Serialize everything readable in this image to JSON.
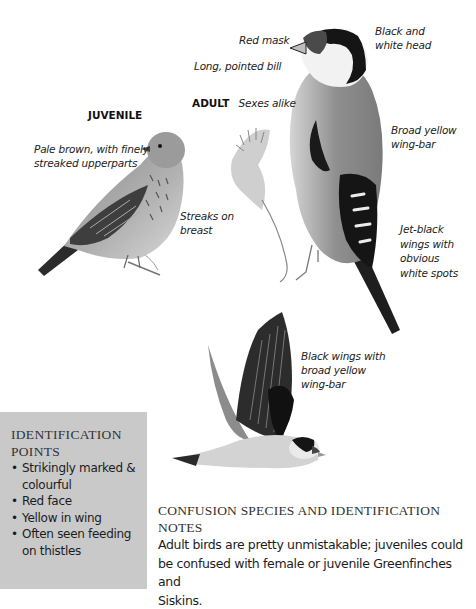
{
  "illustrations": {
    "juvenile": {
      "heading": "JUVENILE",
      "labels": {
        "upperparts": "Pale brown, with finely streaked  upperparts",
        "upperparts_line1": "Pale brown, with finely",
        "upperparts_line2": "streaked  upperparts",
        "breast_line1": "Streaks on",
        "breast_line2": "breast"
      }
    },
    "adult": {
      "heading": "ADULT",
      "subheading": "Sexes alike",
      "labels": {
        "red_mask": "Red mask",
        "bill": "Long, pointed bill",
        "head_line1": "Black and",
        "head_line2": "white head",
        "wingbar_line1": "Broad yellow",
        "wingbar_line2": "wing-bar",
        "wings_line1": "Jet-black",
        "wings_line2": "wings with",
        "wings_line3": "obvious",
        "wings_line4": "white spots"
      }
    },
    "flight": {
      "labels": {
        "line1": "Black wings with",
        "line2": "broad yellow",
        "line3": "wing-bar"
      }
    }
  },
  "identification_points": {
    "title_line1": "IDENTIFICATION",
    "title_line2": "POINTS",
    "items": [
      {
        "line1": "Strikingly marked &",
        "line2": "colourful"
      },
      {
        "line1": "Red face",
        "line2": ""
      },
      {
        "line1": "Yellow in wing",
        "line2": ""
      },
      {
        "line1": "Often seen feeding",
        "line2": "on thistles"
      }
    ]
  },
  "confusion_species": {
    "title": "CONFUSION SPECIES AND IDENTIFICATION NOTES",
    "title_line1": "CONFUSION SPECIES AND IDENTIFICATION",
    "title_line2": "NOTES",
    "body_line1": "Adult birds are pretty unmistakable; juveniles could",
    "body_line2": "be confused with female or juvenile Greenfinches and",
    "body_line3": "Siskins."
  },
  "colors": {
    "box_background": "#c9c9c9",
    "text": "#1a1a1a"
  }
}
